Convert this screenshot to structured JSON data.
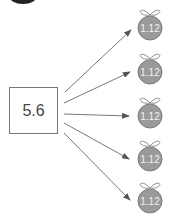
{
  "source": {
    "value": "5.6"
  },
  "targets": [
    {
      "value": "1.12"
    },
    {
      "value": "1.12"
    },
    {
      "value": "1.12"
    },
    {
      "value": "1.12"
    },
    {
      "value": "1.12"
    }
  ],
  "colors": {
    "bag_fill": "#9a9a9a",
    "bag_stroke": "#7d7d7d",
    "arrow": "#555555",
    "box_stroke": "#777777",
    "corner_blob": "#222222"
  }
}
